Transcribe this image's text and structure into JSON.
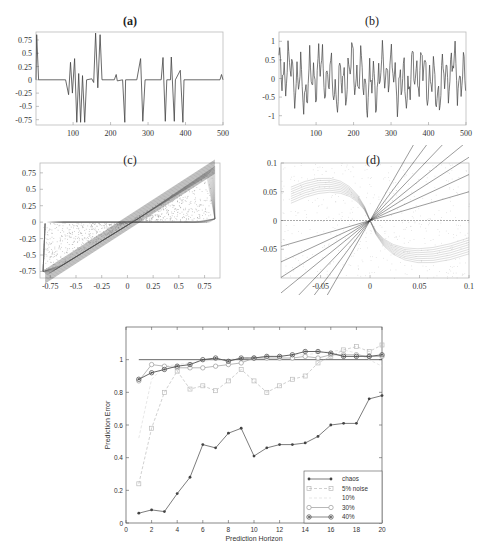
{
  "chart_data": [
    {
      "id": "a",
      "type": "line",
      "title": "(a)",
      "xlabel": "",
      "ylabel": "",
      "xlim": [
        1,
        500
      ],
      "ylim": [
        -0.85,
        0.9
      ],
      "x_ticks": [
        "100",
        "200",
        "300",
        "400",
        "500"
      ],
      "y_ticks": [
        "0.75",
        "0.5",
        "0.25",
        "0",
        "-0.25",
        "-0.5",
        "-0.75"
      ],
      "description": "Time series with long flat zero segments interrupted by bursts of spikes reaching about +0.85 and -0.8"
    },
    {
      "id": "b",
      "type": "line",
      "title": "(b)",
      "xlabel": "",
      "ylabel": "",
      "xlim": [
        1,
        500
      ],
      "ylim": [
        -1.25,
        1.25
      ],
      "x_ticks": [
        "100",
        "200",
        "300",
        "400",
        "500"
      ],
      "y_ticks": [
        "1",
        "0.5",
        "0",
        "-0.5",
        "-1"
      ],
      "description": "Dense chaotic oscillating time series between about -1.2 and 1.2"
    },
    {
      "id": "c",
      "type": "scatter",
      "title": "(c)",
      "xlim": [
        -0.85,
        0.9
      ],
      "ylim": [
        -0.85,
        0.9
      ],
      "x_ticks": [
        "-0.75",
        "-0.5",
        "-0.25",
        "0",
        "0.25",
        "0.5",
        "0.75"
      ],
      "y_ticks": [
        "0.75",
        "0.5",
        "0.25",
        "0",
        "-0.25",
        "-0.5",
        "-0.75"
      ],
      "description": "Phase portrait: parallelogram-shaped attractor with dense diagonal band from (-0.8,-0.8) to (0.85,0.85)"
    },
    {
      "id": "d",
      "type": "scatter",
      "title": "(d)",
      "xlim": [
        -0.09,
        0.1
      ],
      "ylim": [
        -0.1,
        0.1
      ],
      "x_ticks": [
        "-0.05",
        "0",
        "0.05",
        "0.1"
      ],
      "y_ticks": [
        "0.1",
        "0.05",
        "0",
        "-0.05"
      ],
      "description": "Zoom of phase portrait near origin: fan of rays through origin plus curved S-shaped loops"
    },
    {
      "id": "main",
      "type": "line",
      "title": "",
      "xlabel": "Prediction Horizon",
      "ylabel": "Prediction Error",
      "xlim": [
        0,
        20
      ],
      "ylim": [
        0,
        1.2
      ],
      "x_ticks": [
        "0",
        "2",
        "4",
        "6",
        "8",
        "10",
        "12",
        "14",
        "16",
        "18",
        "20"
      ],
      "y_ticks": [
        "0",
        "0.2",
        "0.4",
        "0.6",
        "0.8",
        "1"
      ],
      "reference_line": 1.0,
      "legend_position": "lower right",
      "x": [
        1,
        2,
        3,
        4,
        5,
        6,
        7,
        8,
        9,
        10,
        11,
        12,
        13,
        14,
        15,
        16,
        17,
        18,
        19,
        20
      ],
      "series": [
        {
          "name": "chaos",
          "color": "#444444",
          "style": "solid",
          "marker": "dot",
          "values": [
            0.06,
            0.08,
            0.07,
            0.18,
            0.28,
            0.48,
            0.46,
            0.55,
            0.58,
            0.41,
            0.46,
            0.48,
            0.48,
            0.49,
            0.53,
            0.6,
            0.61,
            0.61,
            0.76,
            0.78
          ]
        },
        {
          "name": "5% noise",
          "color": "#bbbbbb",
          "style": "dashed",
          "marker": "square",
          "values": [
            0.24,
            0.58,
            0.8,
            0.93,
            0.82,
            0.84,
            0.81,
            0.87,
            0.94,
            0.87,
            0.8,
            0.84,
            0.88,
            0.9,
            0.98,
            1.02,
            1.06,
            1.08,
            1.05,
            1.09
          ]
        },
        {
          "name": "10%",
          "color": "#dddddd",
          "style": "dashed",
          "marker": "none",
          "values": [
            0.52,
            0.88,
            0.96,
            0.97,
            0.98,
            0.99,
            1.0,
            1.0,
            1.01,
            1.01,
            1.02,
            1.02,
            1.03,
            1.03,
            1.04,
            1.05,
            1.06,
            1.04,
            1.0,
            0.96
          ]
        },
        {
          "name": "30%",
          "color": "#999999",
          "style": "solid",
          "marker": "circle",
          "values": [
            0.87,
            0.97,
            0.96,
            0.95,
            0.95,
            0.95,
            0.96,
            0.97,
            0.98,
            1.01,
            1.01,
            1.01,
            1.01,
            1.02,
            1.01,
            1.03,
            1.03,
            1.03,
            1.02,
            1.02
          ]
        },
        {
          "name": "40%",
          "color": "#555555",
          "style": "solid",
          "marker": "circle-dot",
          "values": [
            0.88,
            0.92,
            0.94,
            0.96,
            0.97,
            1.0,
            1.01,
            0.99,
            1.01,
            1.01,
            1.02,
            1.02,
            1.03,
            1.05,
            1.05,
            1.04,
            1.02,
            1.02,
            1.02,
            1.03
          ]
        }
      ]
    }
  ],
  "labels": {
    "a": "(a)",
    "b": "(b)",
    "c": "(c)",
    "d": "(d)",
    "main_xlabel": "Prediction Horizon",
    "main_ylabel": "Prediction Error"
  }
}
